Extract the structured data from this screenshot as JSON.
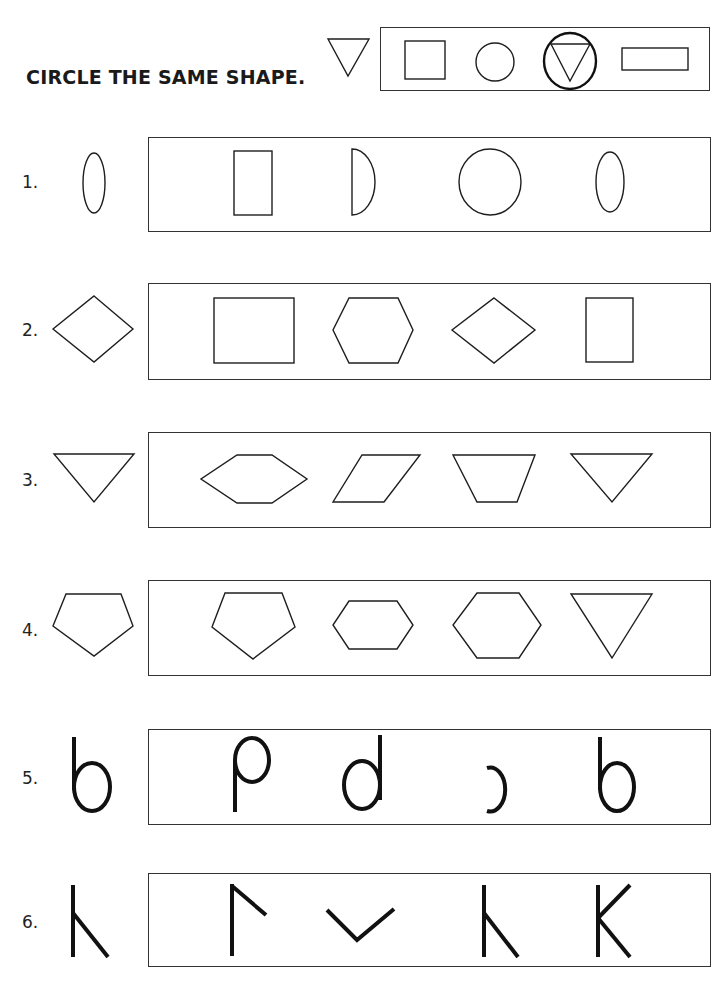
{
  "worksheet": {
    "title": "CIRCLE THE SAME SHAPE.",
    "example": {
      "target": "inverted-triangle",
      "options": [
        "square",
        "circle",
        "inverted-triangle",
        "rectangle"
      ],
      "circled_answer_index": 2
    },
    "questions": [
      {
        "number": "1.",
        "target": "oval",
        "options": [
          "rectangle",
          "half-circle",
          "circle",
          "oval"
        ]
      },
      {
        "number": "2.",
        "target": "diamond",
        "options": [
          "square",
          "hexagon",
          "diamond",
          "rectangle"
        ]
      },
      {
        "number": "3.",
        "target": "inverted-triangle",
        "options": [
          "flat-hexagon",
          "parallelogram",
          "trapezoid",
          "inverted-triangle"
        ]
      },
      {
        "number": "4.",
        "target": "pentagon",
        "options": [
          "pentagon",
          "small-hexagon",
          "hexagon",
          "inverted-triangle"
        ]
      },
      {
        "number": "5.",
        "target": "b",
        "options": [
          "p-shape",
          "d",
          "reversed-c",
          "b"
        ]
      },
      {
        "number": "6.",
        "target": "lambda-k",
        "options": [
          "flag-shape",
          "v-shape",
          "lambda-k",
          "K"
        ]
      }
    ]
  }
}
